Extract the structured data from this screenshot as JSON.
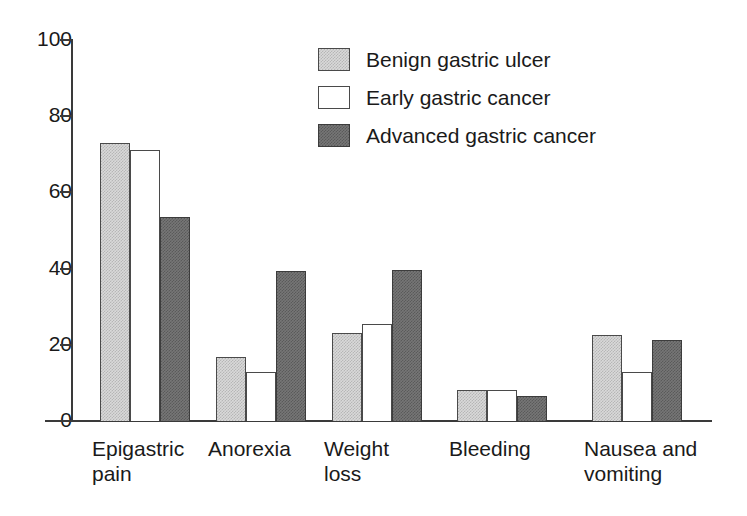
{
  "chart_data": {
    "type": "bar",
    "title": "",
    "subtitle": "",
    "xlabel": "",
    "ylabel": "",
    "ylim": [
      0,
      100
    ],
    "yticks": [
      0,
      20,
      40,
      60,
      80,
      100
    ],
    "grid": false,
    "legend_position": "top-right",
    "categories": [
      "Epigastric\npain",
      "Anorexia",
      "Weight\nloss",
      "Bleeding",
      "Nausea and\nvomiting"
    ],
    "series": [
      {
        "name": "Benign gastric ulcer",
        "color": "#d9d9d9",
        "values": [
          73,
          16.8,
          23.2,
          8.2,
          22.6
        ]
      },
      {
        "name": "Early gastric cancer",
        "color": "#ffffff",
        "values": [
          71.2,
          12.8,
          25.4,
          8.2,
          12.8
        ]
      },
      {
        "name": "Advanced gastric cancer",
        "color": "#767676",
        "values": [
          53.6,
          39.4,
          39.6,
          6.6,
          21.3
        ]
      }
    ]
  },
  "axis": {
    "tick_labels": [
      "100",
      "80",
      "60",
      "40",
      "20",
      "0"
    ]
  },
  "legend": {
    "entries": [
      {
        "label": "Benign gastric ulcer",
        "swatch": "light-gray-hatched"
      },
      {
        "label": "Early gastric cancer",
        "swatch": "white-outline"
      },
      {
        "label": "Advanced gastric cancer",
        "swatch": "dark-gray-hatched"
      }
    ]
  }
}
